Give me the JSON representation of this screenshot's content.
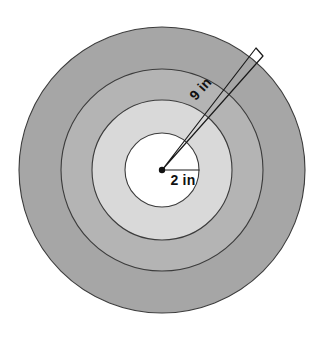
{
  "figure": {
    "labels": {
      "outer_radius": "9 in",
      "inner_radius": "2 in"
    },
    "geometry": {
      "center_x": 162,
      "center_y": 170,
      "radii": [
        143,
        101,
        70,
        37
      ],
      "outer_radius_value": 9,
      "inner_radius_value": 2,
      "units": "in",
      "wedge_angle_deg": -45
    },
    "colors": {
      "background": "#ffffff",
      "outer_ring": "#a6a6a6",
      "middle_ring": "#b3b3b3",
      "inner_ring": "#d9d9d9",
      "bullseye": "#ffffff",
      "outline": "#3c3c3c",
      "line": "#1a1a1a",
      "text": "#111111"
    }
  }
}
